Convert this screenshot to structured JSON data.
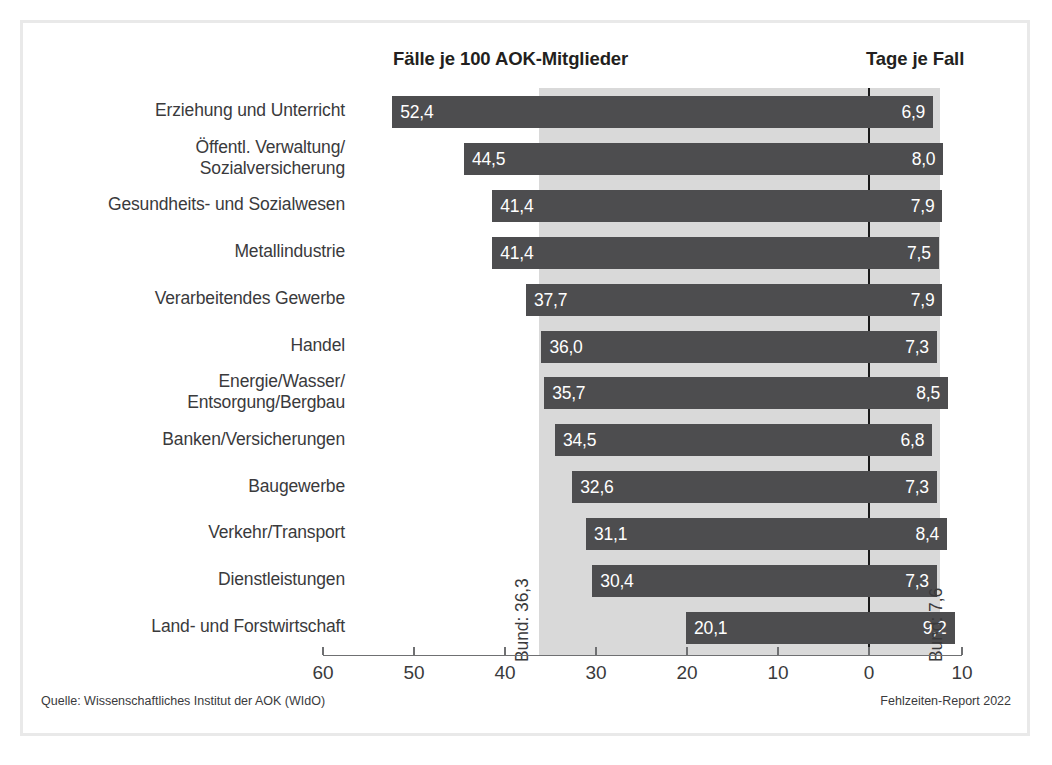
{
  "headers": {
    "left": "Fälle je 100 AOK-Mitglieder",
    "right": "Tage je Fall"
  },
  "annotations": {
    "bund_faelle": "Bund: 36,3",
    "bund_tage": "Bund: 7,6"
  },
  "footer": {
    "source": "Quelle: Wissenschaftliches Institut der AOK (WIdO)",
    "report": "Fehlzeiten-Report 2022"
  },
  "colors": {
    "bar": "#4d4d4f",
    "band": "#d9d9d9",
    "text": "#3a3a3c",
    "zero_line": "#1a1a1a",
    "frame": "#e9e9e9",
    "value_text": "#ffffff"
  },
  "chart_data": {
    "type": "bar",
    "title": "",
    "orientation": "horizontal",
    "grid": false,
    "legend": false,
    "xlabel": "",
    "ylabel": "",
    "axis": {
      "tick_labels": [
        "60",
        "50",
        "40",
        "30",
        "20",
        "10",
        "0",
        "10"
      ],
      "tick_values": [
        60,
        50,
        40,
        30,
        20,
        10,
        0,
        10
      ],
      "left_scale_max": 60,
      "right_scale_max": 10,
      "zero_at": 0,
      "direction": "left-values-decrease-rightward"
    },
    "categories": [
      "Erziehung und Unterricht",
      "Öffentl. Verwaltung/\nSozialversicherung",
      "Gesundheits- und Sozialwesen",
      "Metallindustrie",
      "Verarbeitendes Gewerbe",
      "Handel",
      "Energie/Wasser/\nEntsorgung/Bergbau",
      "Banken/Versicherungen",
      "Baugewerbe",
      "Verkehr/Transport",
      "Dienstleistungen",
      "Land- und Forstwirtschaft"
    ],
    "series": [
      {
        "name": "Fälle je 100 AOK-Mitglieder",
        "values": [
          52.4,
          44.5,
          41.4,
          41.4,
          37.7,
          36.0,
          35.7,
          34.5,
          32.6,
          31.1,
          30.4,
          20.1
        ],
        "labels": [
          "52,4",
          "44,5",
          "41,4",
          "41,4",
          "37,7",
          "36,0",
          "35,7",
          "34,5",
          "32,6",
          "31,1",
          "30,4",
          "20,1"
        ],
        "reference_line": 36.3,
        "reference_label": "Bund: 36,3"
      },
      {
        "name": "Tage je Fall",
        "values": [
          6.9,
          8.0,
          7.9,
          7.5,
          7.9,
          7.3,
          8.5,
          6.8,
          7.3,
          8.4,
          7.3,
          9.2
        ],
        "labels": [
          "6,9",
          "8,0",
          "7,9",
          "7,5",
          "7,9",
          "7,3",
          "8,5",
          "6,8",
          "7,3",
          "8,4",
          "7,3",
          "9,2"
        ],
        "reference_line": 7.6,
        "reference_label": "Bund: 7,6"
      }
    ]
  }
}
